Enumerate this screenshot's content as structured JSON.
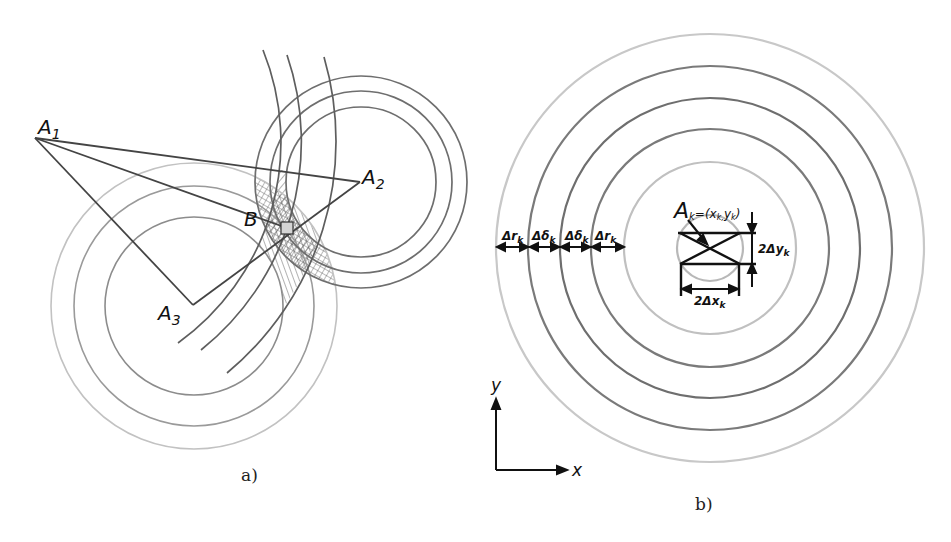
{
  "panel_a": {
    "caption": "a)",
    "points": {
      "A1": {
        "label": "A",
        "sub": "1",
        "x": 35,
        "y": 138
      },
      "A2": {
        "label": "A",
        "sub": "2",
        "x": 360,
        "y": 182
      },
      "A3": {
        "label": "A",
        "sub": "3",
        "x": 193,
        "y": 305
      },
      "B": {
        "label": "B",
        "x": 287,
        "y": 228
      }
    },
    "circles_A2": {
      "cx": 361,
      "cy": 182,
      "radii": [
        75,
        91,
        106
      ],
      "color": "#6e6e6e"
    },
    "circles_A3": {
      "cx": 194,
      "cy": 306,
      "radii": [
        89,
        120,
        143
      ],
      "colors": [
        "#8c8c8c",
        "#9a9a9a",
        "#bdbdbd"
      ]
    },
    "arcs_A1": {
      "cx": 35,
      "cy": 138,
      "radii": [
        247,
        267,
        301
      ],
      "color": "#5e5e5e"
    }
  },
  "panel_b": {
    "caption": "b)",
    "center": {
      "x": 710,
      "y": 248
    },
    "rings": [
      {
        "r": 33,
        "color": "#b8b8b8"
      },
      {
        "r": 86,
        "color": "#bdbdbd"
      },
      {
        "r": 119,
        "color": "#7a7a7a"
      },
      {
        "r": 150,
        "color": "#6e6e6e"
      },
      {
        "r": 182,
        "color": "#7a7a7a"
      },
      {
        "r": 214,
        "color": "#c4c4c4"
      }
    ],
    "point_label": "A",
    "point_sub": "k",
    "point_coords": "=(x",
    "point_coords_sub1": "k,",
    "point_coords_mid": "y",
    "point_coords_sub2": "k",
    "point_coords_end": ")",
    "dimension_labels": [
      {
        "main": "Δr",
        "sub": "k"
      },
      {
        "main": "Δδ",
        "sub": "k"
      },
      {
        "main": "Δδ",
        "sub": "k"
      },
      {
        "main": "Δr",
        "sub": "k"
      }
    ],
    "dy_label": {
      "main": "2Δy",
      "sub": "k"
    },
    "dx_label": {
      "main": "2Δx",
      "sub": "k"
    },
    "axes": {
      "x_label": "x",
      "y_label": "y"
    }
  }
}
